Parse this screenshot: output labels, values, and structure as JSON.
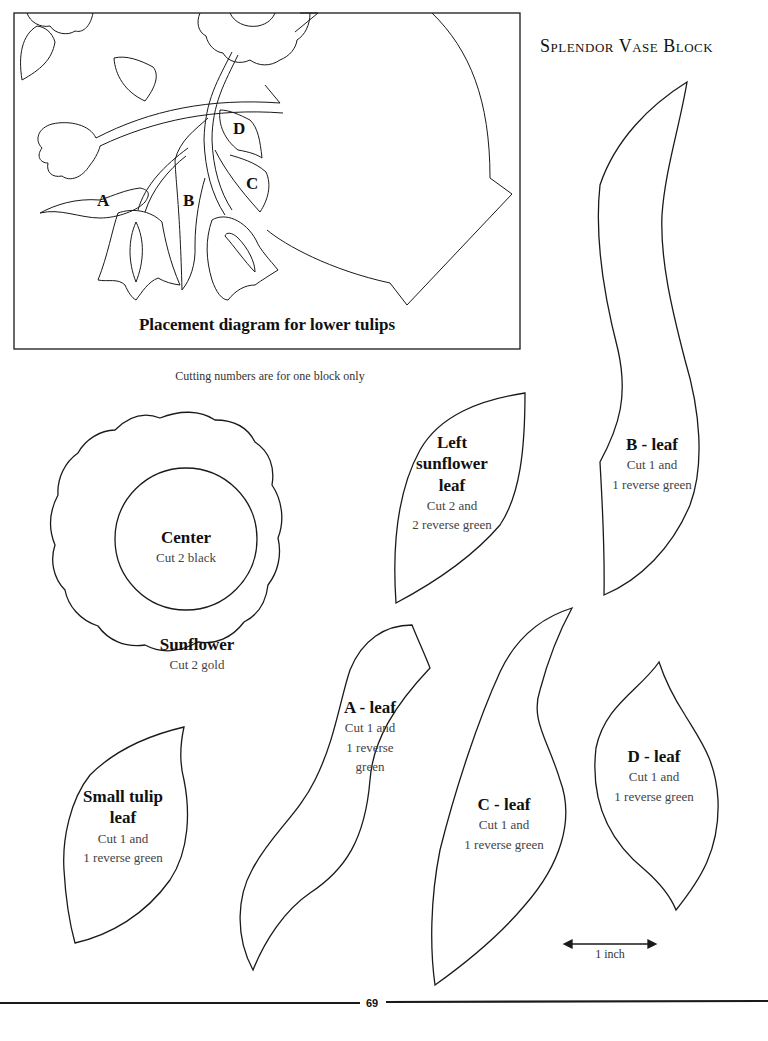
{
  "header": {
    "title": "Splendor Vase Block"
  },
  "placement_diagram": {
    "caption": "Placement diagram for lower tulips",
    "labels": {
      "a": "A",
      "b": "B",
      "c": "C",
      "d": "D"
    }
  },
  "note": "Cutting numbers are for one block only",
  "pieces": {
    "center": {
      "name": "Center",
      "cut": "Cut 2 black"
    },
    "sunflower": {
      "name": "Sunflower",
      "cut": "Cut 2 gold"
    },
    "left_sunflower_leaf": {
      "name_line1": "Left",
      "name_line2": "sunflower",
      "name_line3": "leaf",
      "cut_line1": "Cut 2 and",
      "cut_line2": "2 reverse green"
    },
    "b_leaf": {
      "name": "B - leaf",
      "cut_line1": "Cut 1 and",
      "cut_line2": "1 reverse green"
    },
    "a_leaf": {
      "name": "A - leaf",
      "cut_line1": "Cut 1 and",
      "cut_line2": "1 reverse",
      "cut_line3": "green"
    },
    "c_leaf": {
      "name": "C - leaf",
      "cut_line1": "Cut 1 and",
      "cut_line2": "1 reverse green"
    },
    "d_leaf": {
      "name": "D - leaf",
      "cut_line1": "Cut 1 and",
      "cut_line2": "1 reverse green"
    },
    "small_tulip_leaf": {
      "name_line1": "Small tulip",
      "name_line2": "leaf",
      "cut_line1": "Cut 1 and",
      "cut_line2": "1 reverse green"
    }
  },
  "scale": {
    "label": "1 inch"
  },
  "footer": {
    "page_number": "69"
  }
}
